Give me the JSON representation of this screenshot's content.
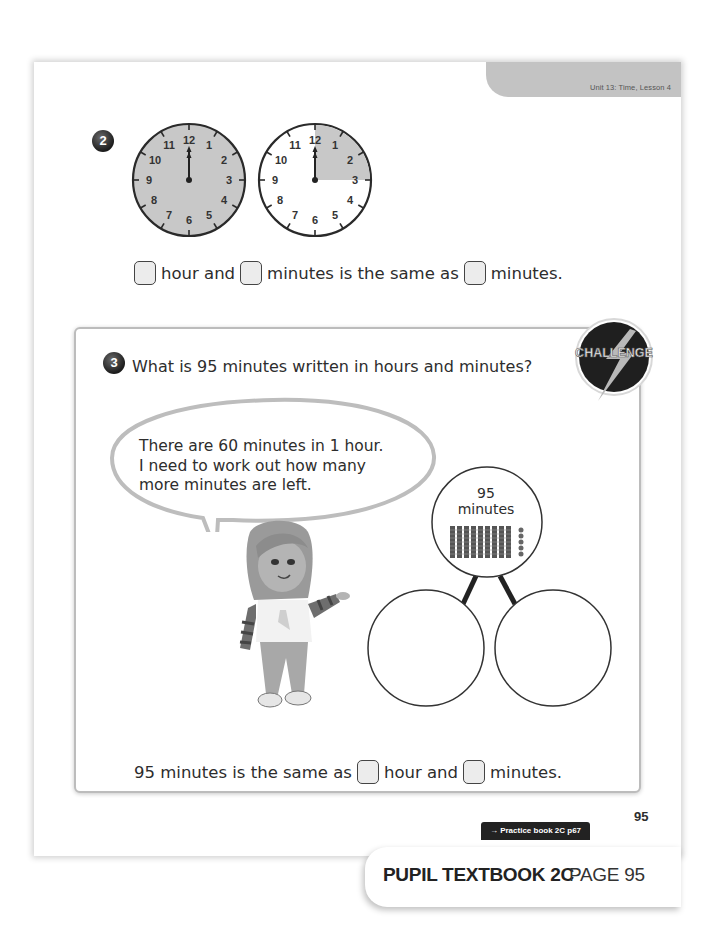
{
  "header": {
    "unit_label": "Unit 13: Time, Lesson 4"
  },
  "question2": {
    "number": "2",
    "clocks": [
      {
        "name": "full-hour-clock",
        "shading": "full",
        "time": "12:00",
        "numbers": [
          "12",
          "1",
          "2",
          "3",
          "4",
          "5",
          "6",
          "7",
          "8",
          "9",
          "10",
          "11"
        ]
      },
      {
        "name": "quarter-hour-clock",
        "shading": "12-to-3",
        "time": "12:00",
        "numbers": [
          "12",
          "1",
          "2",
          "3",
          "4",
          "5",
          "6",
          "7",
          "8",
          "9",
          "10",
          "11"
        ]
      }
    ],
    "sentence": {
      "part1": "hour and",
      "part2": "minutes is the same as",
      "part3": "minutes."
    }
  },
  "question3": {
    "number": "3",
    "text": "What is 95 minutes written in hours and minutes?",
    "badge": "CHALLENGE",
    "speech_bubble": {
      "lines": [
        "There are 60 minutes in 1 hour.",
        "I need to work out how many",
        "more minutes are left."
      ]
    },
    "part_whole": {
      "whole_number": "95",
      "whole_unit": "minutes",
      "tens_rods": 9,
      "ones_cubes": 5,
      "parts": [
        "",
        ""
      ]
    },
    "sentence": {
      "part1": "95 minutes is the same as",
      "part2": "hour and",
      "part3": "minutes."
    }
  },
  "footer": {
    "page_number": "95",
    "practice_link": "→ Practice book 2C p67",
    "book_title": "PUPIL TEXTBOOK 2C",
    "page_label": "PAGE 95"
  }
}
